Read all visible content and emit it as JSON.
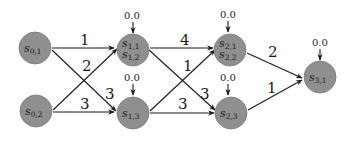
{
  "diagram": {
    "type": "layered directed graph",
    "colors": {
      "node_fill": "#8f8f8f",
      "edge": "#1a1a1a",
      "background": "#ffffff"
    },
    "nodes": [
      {
        "id": "s01",
        "base": "s",
        "sub": "0,1",
        "sub2": null,
        "cx": 35,
        "cy": 48,
        "init": null
      },
      {
        "id": "s02",
        "base": "s",
        "sub": "0,2",
        "sub2": null,
        "cx": 36,
        "cy": 111,
        "init": null
      },
      {
        "id": "s11",
        "base": "s",
        "sub": "1,1",
        "sub2": "1,2",
        "cx": 133,
        "cy": 51,
        "init": "0.0"
      },
      {
        "id": "s13",
        "base": "s",
        "sub": "1,3",
        "sub2": null,
        "cx": 133,
        "cy": 113,
        "init": "0.0"
      },
      {
        "id": "s21",
        "base": "s",
        "sub": "2,1",
        "sub2": "2,2",
        "cx": 231,
        "cy": 50,
        "init": "0.0"
      },
      {
        "id": "s23",
        "base": "s",
        "sub": "2,3",
        "sub2": null,
        "cx": 232,
        "cy": 113,
        "init": "0.0"
      },
      {
        "id": "s31",
        "base": "s",
        "sub": "3,1",
        "sub2": null,
        "cx": 320,
        "cy": 77,
        "init": "0.0"
      }
    ],
    "edges": [
      {
        "from": "s01",
        "to": "s11",
        "label": "1"
      },
      {
        "from": "s01",
        "to": "s13",
        "label": "3"
      },
      {
        "from": "s02",
        "to": "s11",
        "label": "2"
      },
      {
        "from": "s02",
        "to": "s13",
        "label": "3"
      },
      {
        "from": "s11",
        "to": "s21",
        "label": "4"
      },
      {
        "from": "s11",
        "to": "s23",
        "label": "3"
      },
      {
        "from": "s13",
        "to": "s21",
        "label": "1"
      },
      {
        "from": "s13",
        "to": "s23",
        "label": "3"
      },
      {
        "from": "s21",
        "to": "s31",
        "label": "2"
      },
      {
        "from": "s23",
        "to": "s31",
        "label": "1"
      }
    ]
  },
  "labels": {
    "n0": {
      "base": "s",
      "sub": "0,1"
    },
    "n1": {
      "base": "s",
      "sub": "0,2"
    },
    "n2": {
      "base": "s",
      "sub": "1,1",
      "sub2": "1,2"
    },
    "n3": {
      "base": "s",
      "sub": "1,3"
    },
    "n4": {
      "base": "s",
      "sub": "2,1",
      "sub2": "2,2"
    },
    "n5": {
      "base": "s",
      "sub": "2,3"
    },
    "n6": {
      "base": "s",
      "sub": "3,1"
    },
    "init": [
      "0.0",
      "0.0",
      "0.0",
      "0.0",
      "0.0"
    ],
    "edge_labels": [
      "1",
      "2",
      "3",
      "3",
      "4",
      "1",
      "3",
      "3",
      "2",
      "1"
    ]
  }
}
